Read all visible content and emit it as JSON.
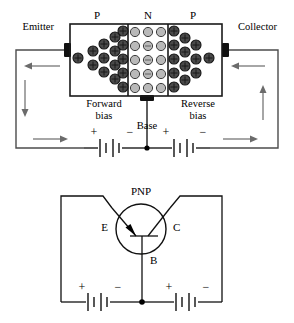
{
  "figure": {
    "caption": ""
  },
  "top_diagram": {
    "name": "pnp-block-diagram",
    "region_labels": {
      "left_region": "P",
      "middle_region": "N",
      "right_region": "P"
    },
    "terminal_labels": {
      "emitter": "Emitter",
      "collector": "Collector",
      "base": "Base"
    },
    "bias_labels": {
      "left": "Forward",
      "left_second_line": "bias",
      "right": "Reverse",
      "right_second_line": "bias"
    },
    "battery_polarity": {
      "left_battery_positive": "+",
      "left_battery_negative": "−",
      "right_battery_positive": "+",
      "right_battery_negative": "−"
    },
    "carriers": {
      "left_p_symbol": "+",
      "right_p_symbol": "+",
      "n_symbol": "",
      "left_p_count": 13,
      "n_count": 15,
      "right_p_count": 13,
      "dark_fill": "#4a4a4a",
      "light_fill": "#b9b9b9"
    },
    "current_arrow_directions": {
      "top_left": "left",
      "left_side": "down",
      "bottom_left": "right",
      "top_right": "left",
      "right_side": "up",
      "bottom_right": "right"
    }
  },
  "bottom_diagram": {
    "name": "pnp-schematic-symbol",
    "device_label": "PNP",
    "terminal_labels": {
      "emitter": "E",
      "collector": "C",
      "base": "B"
    },
    "battery_polarity": {
      "left_battery_positive": "+",
      "left_battery_negative": "−",
      "right_battery_positive": "+",
      "right_battery_negative": "−"
    }
  },
  "colors": {
    "background": "#ffffff",
    "line": "#111111",
    "wire_gray": "#4c4c4c",
    "arrow_gray": "#6b6b6b"
  }
}
